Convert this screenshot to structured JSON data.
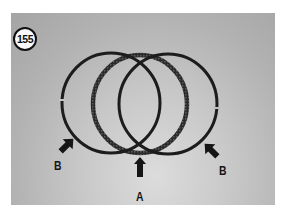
{
  "figure": {
    "number_badge": "155",
    "labels": [
      {
        "id": "B-left",
        "text": "B"
      },
      {
        "id": "A",
        "text": "A"
      },
      {
        "id": "B-right",
        "text": "B"
      }
    ]
  },
  "colors": {
    "ring": "#1e1e1e",
    "background_top": "#a4a4a4",
    "background_bottom": "#dcdcdc",
    "frame": "#ffffff"
  }
}
